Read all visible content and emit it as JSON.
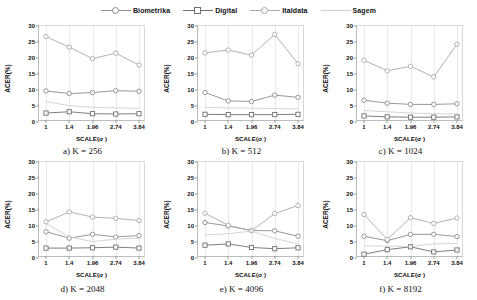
{
  "legend": {
    "position": "top-center",
    "items": [
      {
        "label": "Biometrika",
        "color": "#8c8c8c",
        "marker": "circle"
      },
      {
        "label": "Digital",
        "color": "#6f6f6f",
        "marker": "square"
      },
      {
        "label": "Italdata",
        "color": "#a9a9a9",
        "marker": "circle"
      },
      {
        "label": "Sagem",
        "color": "#cfcfcf",
        "marker": "none"
      }
    ]
  },
  "axes": {
    "ylabel": "ACER(%)",
    "xlabel": "SCALE(σ )",
    "yticks": [
      0,
      5,
      10,
      15,
      20,
      25,
      30
    ],
    "ylim": [
      0,
      30
    ],
    "xticklabels": [
      "1",
      "1.4",
      "1.96",
      "2.74",
      "3.84"
    ]
  },
  "chart_data": [
    {
      "type": "line",
      "title": "a) K = 256",
      "xlabel": "SCALE(σ )",
      "ylabel": "ACER(%)",
      "categories": [
        "1",
        "1.4",
        "1.96",
        "2.74",
        "3.84"
      ],
      "ylim": [
        0,
        30
      ],
      "grid": true,
      "series": [
        {
          "name": "Biometrika",
          "values": [
            9.7,
            8.9,
            9.2,
            9.8,
            9.6
          ]
        },
        {
          "name": "Digital",
          "values": [
            2.8,
            3.2,
            2.6,
            2.5,
            2.6
          ]
        },
        {
          "name": "Italdata",
          "values": [
            26.7,
            23.4,
            19.8,
            21.5,
            17.8
          ]
        },
        {
          "name": "Sagem",
          "values": [
            6.4,
            5.1,
            4.6,
            4.4,
            4.3
          ]
        }
      ]
    },
    {
      "type": "line",
      "title": "b) K = 512",
      "xlabel": "SCALE(σ )",
      "ylabel": "ACER(%)",
      "categories": [
        "1",
        "1.4",
        "1.96",
        "2.74",
        "3.84"
      ],
      "ylim": [
        0,
        30
      ],
      "grid": true,
      "series": [
        {
          "name": "Biometrika",
          "values": [
            9.2,
            6.6,
            6.4,
            8.4,
            7.7
          ]
        },
        {
          "name": "Digital",
          "values": [
            2.4,
            2.3,
            2.3,
            2.3,
            2.4
          ]
        },
        {
          "name": "Italdata",
          "values": [
            21.6,
            22.5,
            20.9,
            27.4,
            18.2
          ]
        },
        {
          "name": "Sagem",
          "values": [
            4.6,
            4.4,
            4.3,
            4.2,
            4.1
          ]
        }
      ]
    },
    {
      "type": "line",
      "title": "c) K = 1024",
      "xlabel": "SCALE(σ )",
      "ylabel": "ACER(%)",
      "categories": [
        "1",
        "1.4",
        "1.96",
        "2.74",
        "3.84"
      ],
      "ylim": [
        0,
        30
      ],
      "grid": true,
      "series": [
        {
          "name": "Biometrika",
          "values": [
            6.8,
            5.9,
            5.5,
            5.5,
            5.7
          ]
        },
        {
          "name": "Digital",
          "values": [
            1.9,
            1.6,
            1.5,
            1.5,
            1.6
          ]
        },
        {
          "name": "Italdata",
          "values": [
            19.3,
            16.0,
            17.4,
            14.1,
            24.3
          ]
        },
        {
          "name": "Sagem",
          "values": [
            3.6,
            3.2,
            2.8,
            2.6,
            2.5
          ]
        }
      ]
    },
    {
      "type": "line",
      "title": "d) K = 2048",
      "xlabel": "SCALE(σ )",
      "ylabel": "ACER(%)",
      "categories": [
        "1",
        "1.4",
        "1.96",
        "2.74",
        "3.84"
      ],
      "ylim": [
        0,
        30
      ],
      "grid": true,
      "series": [
        {
          "name": "Biometrika",
          "values": [
            8.2,
            6.2,
            7.4,
            6.6,
            7.0
          ]
        },
        {
          "name": "Digital",
          "values": [
            3.1,
            3.1,
            3.2,
            3.4,
            3.1
          ]
        },
        {
          "name": "Italdata",
          "values": [
            11.3,
            14.4,
            12.8,
            12.4,
            11.7
          ]
        },
        {
          "name": "Sagem",
          "values": [
            10.8,
            6.6,
            5.1,
            5.9,
            6.2
          ]
        }
      ]
    },
    {
      "type": "line",
      "title": "e) K = 4096",
      "xlabel": "SCALE(σ )",
      "ylabel": "ACER(%)",
      "categories": [
        "1",
        "1.4",
        "1.96",
        "2.74",
        "3.84"
      ],
      "ylim": [
        0,
        30
      ],
      "grid": true,
      "series": [
        {
          "name": "Biometrika",
          "values": [
            11.1,
            10.0,
            8.6,
            8.5,
            6.8
          ]
        },
        {
          "name": "Digital",
          "values": [
            4.0,
            4.4,
            3.3,
            2.9,
            3.2
          ]
        },
        {
          "name": "Italdata",
          "values": [
            14.0,
            10.2,
            8.5,
            13.9,
            16.4
          ]
        },
        {
          "name": "Sagem",
          "values": [
            7.2,
            7.6,
            8.4,
            6.1,
            4.4
          ]
        }
      ]
    },
    {
      "type": "line",
      "title": "f) K = 8192",
      "xlabel": "SCALE(σ )",
      "ylabel": "ACER(%)",
      "categories": [
        "1",
        "1.4",
        "1.96",
        "2.74",
        "3.84"
      ],
      "ylim": [
        0,
        30
      ],
      "grid": true,
      "series": [
        {
          "name": "Biometrika",
          "values": [
            6.8,
            5.4,
            7.4,
            7.4,
            6.7
          ]
        },
        {
          "name": "Digital",
          "values": [
            1.2,
            2.6,
            3.5,
            1.9,
            2.5
          ]
        },
        {
          "name": "Italdata",
          "values": [
            13.6,
            5.8,
            12.6,
            10.8,
            12.5
          ]
        },
        {
          "name": "Sagem",
          "values": [
            3.8,
            3.7,
            3.6,
            4.4,
            4.6
          ]
        }
      ]
    }
  ]
}
